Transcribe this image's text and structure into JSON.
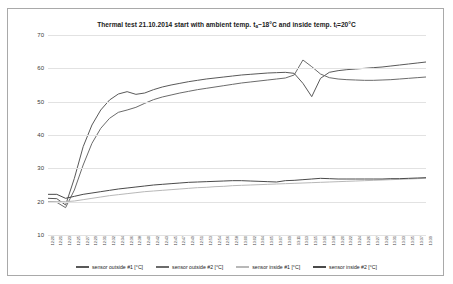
{
  "chart_data": {
    "type": "line",
    "title": "Thermal test 21.10.2014 start with ambient temp. ta~18°C and inside temp. ti=20°C",
    "title_parts": {
      "before_ta": "Thermal test 21.10.2014 start with ambient temp. t",
      "ta_sub": "a",
      "mid": "~18°C and inside temp. t",
      "ti_sub": "i",
      "after": "=20°C"
    },
    "xlabel": "",
    "ylabel": "",
    "ylim": [
      10,
      70
    ],
    "yticks": [
      70,
      60,
      50,
      40,
      30,
      20,
      10
    ],
    "grid": true,
    "legend_position": "bottom",
    "x": [
      "12:20",
      "12:21",
      "12:23",
      "12:25",
      "12:27",
      "12:29",
      "12:31",
      "12:32",
      "12:34",
      "12:36",
      "12:38",
      "12:40",
      "12:42",
      "12:43",
      "12:45",
      "12:47",
      "12:49",
      "12:51",
      "12:53",
      "12:54",
      "12:56",
      "12:58",
      "13:00",
      "13:02",
      "13:04",
      "13:05",
      "13:07",
      "13:09",
      "13:11",
      "13:13",
      "13:15",
      "13:16",
      "13:18",
      "13:20",
      "13:22",
      "13:24",
      "13:26",
      "13:27",
      "13:29",
      "13:31",
      "13:33",
      "13:35",
      "13:37",
      "13:39"
    ],
    "series": [
      {
        "name": "sensor outside #1 [°C]",
        "color": "#595959",
        "values": [
          21.0,
          20.9,
          19.0,
          27.0,
          36.5,
          43.0,
          47.5,
          50.5,
          52.3,
          53.0,
          52.2,
          52.6,
          53.6,
          54.4,
          55.0,
          55.5,
          56.0,
          56.4,
          56.8,
          57.1,
          57.4,
          57.7,
          58.0,
          58.2,
          58.4,
          58.6,
          58.7,
          58.8,
          58.5,
          55.5,
          51.5,
          57.0,
          58.8,
          59.3,
          59.6,
          59.8,
          60.0,
          60.2,
          60.4,
          60.7,
          61.0,
          61.3,
          61.6,
          61.9
        ]
      },
      {
        "name": "sensor outside #2 [°C]",
        "color": "#6b6b6b",
        "values": [
          20.0,
          19.8,
          18.2,
          23.5,
          31.0,
          37.5,
          42.0,
          45.0,
          46.8,
          47.5,
          48.3,
          49.5,
          50.6,
          51.4,
          52.0,
          52.6,
          53.1,
          53.6,
          54.0,
          54.4,
          54.8,
          55.2,
          55.6,
          55.9,
          56.2,
          56.5,
          56.8,
          57.1,
          58.0,
          62.5,
          60.5,
          58.3,
          57.2,
          56.8,
          56.6,
          56.5,
          56.4,
          56.4,
          56.5,
          56.6,
          56.8,
          57.0,
          57.2,
          57.4
        ]
      },
      {
        "name": "sensor inside #1 [°C]",
        "color": "#b8b8b8",
        "values": [
          20.0,
          20.0,
          20.0,
          20.2,
          20.6,
          21.0,
          21.4,
          21.8,
          22.1,
          22.4,
          22.7,
          23.0,
          23.2,
          23.4,
          23.6,
          23.8,
          24.0,
          24.2,
          24.3,
          24.5,
          24.6,
          24.8,
          24.9,
          25.0,
          25.1,
          25.2,
          25.3,
          25.4,
          25.5,
          25.6,
          25.7,
          25.8,
          25.9,
          26.0,
          26.1,
          26.2,
          26.3,
          26.4,
          26.5,
          26.6,
          26.7,
          26.8,
          26.9,
          27.0
        ]
      },
      {
        "name": "sensor inside #2 [°C]",
        "color": "#4a4a4a",
        "values": [
          22.2,
          22.2,
          21.0,
          21.6,
          22.2,
          22.6,
          23.0,
          23.4,
          23.8,
          24.1,
          24.4,
          24.7,
          25.0,
          25.2,
          25.4,
          25.6,
          25.8,
          25.9,
          26.0,
          26.1,
          26.2,
          26.3,
          26.3,
          26.2,
          26.1,
          26.0,
          25.9,
          26.3,
          26.4,
          26.6,
          26.8,
          27.0,
          26.9,
          26.8,
          26.8,
          26.8,
          26.8,
          26.8,
          26.8,
          26.9,
          26.9,
          27.0,
          27.1,
          27.2
        ]
      }
    ]
  }
}
